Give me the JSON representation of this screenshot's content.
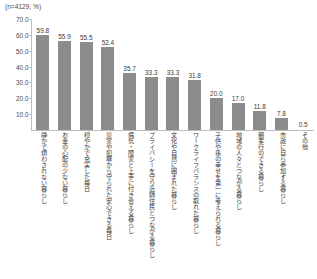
{
  "header": {
    "note": "(n=4129, %)"
  },
  "chart_data": {
    "type": "bar",
    "title": "",
    "subtitle": "(n=4129, %)",
    "xlabel": "",
    "ylabel": "",
    "ylim": [
      0,
      70
    ],
    "grid": false,
    "legend": false,
    "sample_size": 4129,
    "unit": "%",
    "bar_color": "#8c8c8c",
    "axis_color": "#bdbdbd",
    "ytick_labels": [
      "70.0",
      "60.0",
      "50.0",
      "40.0",
      "30.0",
      "20.0",
      "10.0"
    ],
    "yticks": [
      70,
      60,
      50,
      40,
      30,
      20,
      10
    ],
    "categories": [
      "静かで煩わされない暮らし",
      "お金の心配の少ない暮らし",
      "穏やかで充実した毎日",
      "災害や犯罪から守られた安心できる毎日",
      "病気・障害と上手に付き合える暮らし",
      "プライバシーを守り近隣住民とつながる暮らし",
      "文化や自然に囲まれた暮らし",
      "ワークライフバランスの取れた暮らし",
      "子供や孫の幸せを第一に考えられる暮らし",
      "地域の人々とつながる暮らし",
      "親孝行のできる暮らし",
      "市政に自ら参加する暮らし",
      "その他"
    ],
    "values": [
      59.8,
      55.9,
      55.5,
      52.4,
      35.7,
      33.3,
      33.3,
      31.8,
      20.0,
      17.0,
      11.8,
      7.8,
      0.5
    ],
    "value_labels": [
      "59.8",
      "55.9",
      "55.5",
      "52.4",
      "35.7",
      "33.3",
      "33.3",
      "31.8",
      "20.0",
      "17.0",
      "11.8",
      "7.8",
      "0.5"
    ]
  }
}
